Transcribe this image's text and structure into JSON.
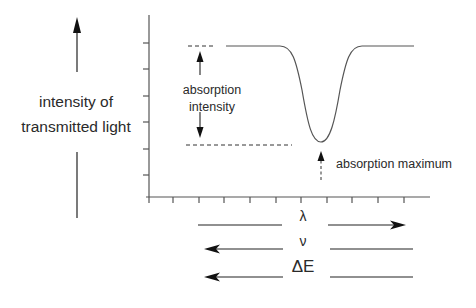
{
  "diagram": {
    "y_axis_label_line1": "intensity of",
    "y_axis_label_line2": "transmitted light",
    "annotation_absorption_intensity_line1": "absorption",
    "annotation_absorption_intensity_line2": "intensity",
    "annotation_absorption_maximum": "absorption maximum",
    "x_scales": [
      {
        "symbol": "λ",
        "direction": "increases-right"
      },
      {
        "symbol": "ν",
        "direction": "increases-left"
      },
      {
        "symbol": "ΔE",
        "direction": "increases-left"
      }
    ],
    "colors": {
      "line": "#444444",
      "text": "#2a2a2a",
      "background": "#ffffff"
    }
  }
}
